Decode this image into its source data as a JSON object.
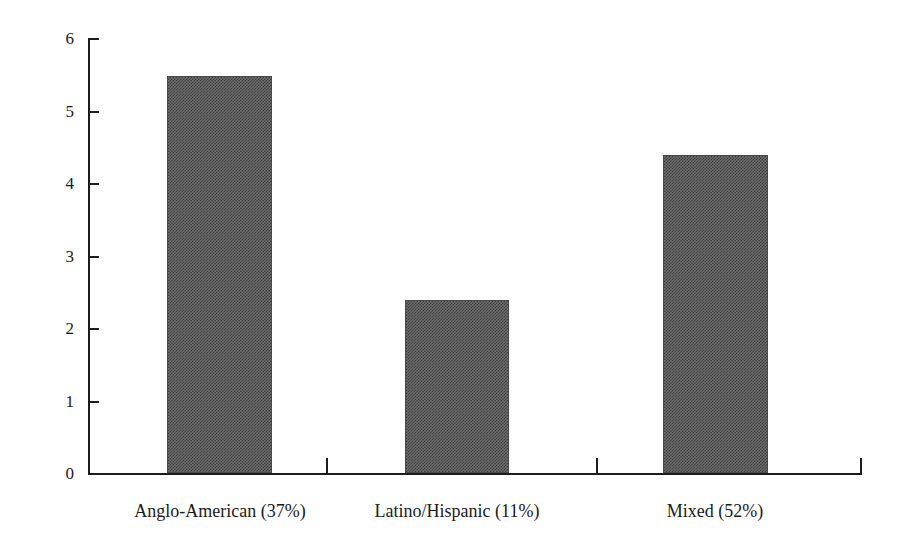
{
  "chart_data": {
    "type": "bar",
    "title": "",
    "subtitle": "",
    "xlabel": "",
    "ylabel": "",
    "categories": [
      "Anglo-American (37%)",
      "Latino/Hispanic (11%)",
      "Mixed (52%)"
    ],
    "values": [
      5.48,
      2.38,
      4.39
    ],
    "ylim": [
      0,
      6
    ],
    "yticks": [
      0,
      1,
      2,
      3,
      4,
      5,
      6
    ],
    "ytick_labels": [
      "0",
      "1",
      "2",
      "3",
      "4",
      "5",
      "6"
    ],
    "grid": false,
    "legend": null,
    "series": [
      {
        "name": "",
        "values": [
          5.48,
          2.38,
          4.39
        ]
      }
    ],
    "annotations": [],
    "bar_color": "#6d6d6d",
    "bar_pattern": "checkerboard-dither",
    "axis_color": "#1c1c1c"
  },
  "axis": {
    "y_ticks": [
      {
        "label": "6",
        "value": 6
      },
      {
        "label": "5",
        "value": 5
      },
      {
        "label": "4",
        "value": 4
      },
      {
        "label": "3",
        "value": 3
      },
      {
        "label": "2",
        "value": 2
      },
      {
        "label": "1",
        "value": 1
      },
      {
        "label": "0",
        "value": 0
      }
    ],
    "x_categories": [
      {
        "label": "Anglo-American (37%)"
      },
      {
        "label": "Latino/Hispanic (11%)"
      },
      {
        "label": "Mixed (52%)"
      }
    ]
  }
}
